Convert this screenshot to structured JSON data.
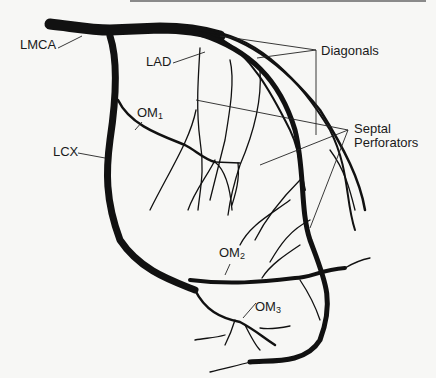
{
  "diagram": {
    "colors": {
      "vessel": "#111111",
      "leader": "#222222",
      "background": "#f7f7f5",
      "top_rule": "#8a8a8a"
    },
    "labels": {
      "lmca": "LMCA",
      "lad": "LAD",
      "om1_base": "OM",
      "om1_sub": "1",
      "lcx": "LCX",
      "diagonals": "Diagonals",
      "septal_line1": "Septal",
      "septal_line2": "Perforators",
      "om2_base": "OM",
      "om2_sub": "2",
      "om3_base": "OM",
      "om3_sub": "3"
    },
    "caption": "Figure"
  }
}
